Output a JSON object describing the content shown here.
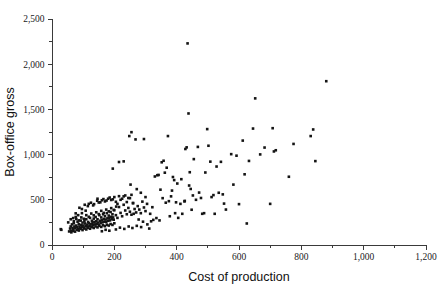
{
  "chart_data": {
    "type": "scatter",
    "title": "",
    "xlabel": "Cost of production",
    "ylabel": "Box-office gross",
    "xlim": [
      0,
      1200
    ],
    "ylim": [
      0,
      2500
    ],
    "grid": false,
    "legend": null,
    "x_ticks": [
      0,
      200,
      400,
      600,
      800,
      1000,
      1200
    ],
    "y_ticks": [
      0,
      500,
      1000,
      1500,
      2000,
      2500
    ],
    "x_tick_labels": [
      "0",
      "200",
      "400",
      "600",
      "800",
      "1,000",
      "1,200"
    ],
    "y_tick_labels": [
      "0",
      "500",
      "1,000",
      "1,500",
      "2,000",
      "2,500"
    ],
    "x_minor_step": 100,
    "y_minor_step": 250,
    "marker": "square",
    "marker_color": "#141414",
    "marker_size": 2.6,
    "points": [
      [
        28,
        175
      ],
      [
        30,
        168
      ],
      [
        55,
        150
      ],
      [
        58,
        182
      ],
      [
        60,
        205
      ],
      [
        62,
        158
      ],
      [
        64,
        228
      ],
      [
        66,
        190
      ],
      [
        68,
        172
      ],
      [
        70,
        240
      ],
      [
        72,
        205
      ],
      [
        74,
        185
      ],
      [
        76,
        350
      ],
      [
        78,
        215
      ],
      [
        80,
        196
      ],
      [
        82,
        258
      ],
      [
        84,
        178
      ],
      [
        86,
        232
      ],
      [
        88,
        205
      ],
      [
        90,
        188
      ],
      [
        92,
        270
      ],
      [
        94,
        222
      ],
      [
        96,
        200
      ],
      [
        98,
        248
      ],
      [
        100,
        215
      ],
      [
        102,
        192
      ],
      [
        104,
        262
      ],
      [
        106,
        238
      ],
      [
        108,
        208
      ],
      [
        110,
        285
      ],
      [
        112,
        225
      ],
      [
        114,
        198
      ],
      [
        116,
        255
      ],
      [
        118,
        240
      ],
      [
        120,
        212
      ],
      [
        122,
        300
      ],
      [
        124,
        232
      ],
      [
        126,
        205
      ],
      [
        128,
        268
      ],
      [
        130,
        245
      ],
      [
        132,
        218
      ],
      [
        134,
        292
      ],
      [
        136,
        255
      ],
      [
        138,
        228
      ],
      [
        140,
        310
      ],
      [
        142,
        262
      ],
      [
        144,
        235
      ],
      [
        146,
        285
      ],
      [
        148,
        248
      ],
      [
        150,
        222
      ],
      [
        152,
        330
      ],
      [
        154,
        268
      ],
      [
        156,
        242
      ],
      [
        158,
        305
      ],
      [
        160,
        275
      ],
      [
        162,
        250
      ],
      [
        164,
        340
      ],
      [
        166,
        288
      ],
      [
        168,
        258
      ],
      [
        170,
        318
      ],
      [
        172,
        282
      ],
      [
        174,
        255
      ],
      [
        176,
        352
      ],
      [
        178,
        295
      ],
      [
        180,
        268
      ],
      [
        182,
        325
      ],
      [
        184,
        298
      ],
      [
        186,
        272
      ],
      [
        188,
        365
      ],
      [
        190,
        312
      ],
      [
        192,
        285
      ],
      [
        194,
        340
      ],
      [
        196,
        305
      ],
      [
        198,
        280
      ],
      [
        200,
        385
      ],
      [
        205,
        330
      ],
      [
        210,
        300
      ],
      [
        215,
        420
      ],
      [
        220,
        355
      ],
      [
        225,
        318
      ],
      [
        230,
        445
      ],
      [
        235,
        382
      ],
      [
        240,
        340
      ],
      [
        245,
        410
      ],
      [
        250,
        368
      ],
      [
        255,
        335
      ],
      [
        260,
        465
      ],
      [
        265,
        398
      ],
      [
        270,
        360
      ],
      [
        275,
        430
      ],
      [
        280,
        392
      ],
      [
        285,
        352
      ],
      [
        290,
        480
      ],
      [
        295,
        415
      ],
      [
        300,
        375
      ],
      [
        62,
        140
      ],
      [
        68,
        155
      ],
      [
        74,
        148
      ],
      [
        80,
        168
      ],
      [
        86,
        160
      ],
      [
        92,
        178
      ],
      [
        98,
        165
      ],
      [
        104,
        182
      ],
      [
        110,
        172
      ],
      [
        116,
        190
      ],
      [
        122,
        180
      ],
      [
        128,
        198
      ],
      [
        134,
        188
      ],
      [
        140,
        205
      ],
      [
        146,
        195
      ],
      [
        152,
        212
      ],
      [
        158,
        200
      ],
      [
        164,
        218
      ],
      [
        170,
        208
      ],
      [
        176,
        225
      ],
      [
        182,
        215
      ],
      [
        188,
        232
      ],
      [
        194,
        222
      ],
      [
        200,
        240
      ],
      [
        70,
        262
      ],
      [
        78,
        288
      ],
      [
        86,
        272
      ],
      [
        94,
        305
      ],
      [
        102,
        290
      ],
      [
        110,
        330
      ],
      [
        118,
        312
      ],
      [
        126,
        348
      ],
      [
        134,
        328
      ],
      [
        142,
        362
      ],
      [
        150,
        342
      ],
      [
        158,
        378
      ],
      [
        166,
        355
      ],
      [
        174,
        392
      ],
      [
        182,
        372
      ],
      [
        190,
        408
      ],
      [
        198,
        388
      ],
      [
        206,
        425
      ],
      [
        88,
        412
      ],
      [
        96,
        398
      ],
      [
        105,
        445
      ],
      [
        115,
        430
      ],
      [
        125,
        468
      ],
      [
        135,
        452
      ],
      [
        145,
        490
      ],
      [
        155,
        472
      ],
      [
        165,
        508
      ],
      [
        175,
        492
      ],
      [
        185,
        525
      ],
      [
        195,
        505
      ],
      [
        205,
        478
      ],
      [
        215,
        540
      ],
      [
        225,
        512
      ],
      [
        235,
        548
      ],
      [
        245,
        520
      ],
      [
        255,
        555
      ],
      [
        150,
        470
      ],
      [
        160,
        495
      ],
      [
        170,
        482
      ],
      [
        180,
        512
      ],
      [
        190,
        498
      ],
      [
        200,
        530
      ],
      [
        210,
        455
      ],
      [
        220,
        500
      ],
      [
        230,
        538
      ],
      [
        240,
        475
      ],
      [
        250,
        518
      ],
      [
        260,
        462
      ],
      [
        195,
        845
      ],
      [
        215,
        918
      ],
      [
        230,
        925
      ],
      [
        248,
        1205
      ],
      [
        252,
        668
      ],
      [
        255,
        1248
      ],
      [
        268,
        1168
      ],
      [
        272,
        618
      ],
      [
        285,
        578
      ],
      [
        295,
        1172
      ],
      [
        300,
        530
      ],
      [
        305,
        455
      ],
      [
        312,
        182
      ],
      [
        318,
        262
      ],
      [
        325,
        278
      ],
      [
        330,
        758
      ],
      [
        338,
        772
      ],
      [
        342,
        775
      ],
      [
        348,
        612
      ],
      [
        352,
        915
      ],
      [
        358,
        932
      ],
      [
        362,
        800
      ],
      [
        368,
        855
      ],
      [
        372,
        1205
      ],
      [
        375,
        485
      ],
      [
        378,
        318
      ],
      [
        382,
        538
      ],
      [
        388,
        752
      ],
      [
        392,
        718
      ],
      [
        395,
        352
      ],
      [
        398,
        472
      ],
      [
        405,
        300
      ],
      [
        412,
        455
      ],
      [
        418,
        345
      ],
      [
        425,
        482
      ],
      [
        428,
        1062
      ],
      [
        432,
        1080
      ],
      [
        435,
        2230
      ],
      [
        438,
        1455
      ],
      [
        442,
        805
      ],
      [
        445,
        620
      ],
      [
        448,
        390
      ],
      [
        452,
        548
      ],
      [
        455,
        950
      ],
      [
        462,
        500
      ],
      [
        468,
        1085
      ],
      [
        472,
        580
      ],
      [
        478,
        520
      ],
      [
        482,
        345
      ],
      [
        488,
        352
      ],
      [
        492,
        802
      ],
      [
        498,
        1282
      ],
      [
        502,
        1098
      ],
      [
        508,
        922
      ],
      [
        512,
        530
      ],
      [
        518,
        552
      ],
      [
        522,
        345
      ],
      [
        528,
        868
      ],
      [
        535,
        578
      ],
      [
        542,
        920
      ],
      [
        548,
        560
      ],
      [
        552,
        458
      ],
      [
        558,
        392
      ],
      [
        575,
        1005
      ],
      [
        582,
        668
      ],
      [
        592,
        988
      ],
      [
        600,
        452
      ],
      [
        612,
        1155
      ],
      [
        618,
        782
      ],
      [
        625,
        238
      ],
      [
        632,
        930
      ],
      [
        645,
        1288
      ],
      [
        652,
        1622
      ],
      [
        668,
        1002
      ],
      [
        682,
        1078
      ],
      [
        700,
        455
      ],
      [
        708,
        1292
      ],
      [
        712,
        1035
      ],
      [
        718,
        1048
      ],
      [
        760,
        755
      ],
      [
        775,
        1118
      ],
      [
        830,
        1205
      ],
      [
        838,
        1278
      ],
      [
        845,
        928
      ],
      [
        880,
        1812
      ],
      [
        118,
        455
      ],
      [
        132,
        438
      ],
      [
        146,
        512
      ],
      [
        108,
        380
      ],
      [
        96,
        352
      ],
      [
        84,
        330
      ],
      [
        76,
        310
      ],
      [
        68,
        298
      ],
      [
        60,
        285
      ],
      [
        52,
        250
      ],
      [
        262,
        345
      ],
      [
        278,
        282
      ],
      [
        292,
        258
      ],
      [
        306,
        228
      ],
      [
        315,
        345
      ],
      [
        322,
        418
      ],
      [
        335,
        298
      ],
      [
        345,
        272
      ],
      [
        355,
        518
      ],
      [
        365,
        468
      ],
      [
        385,
        602
      ],
      [
        402,
        680
      ],
      [
        415,
        728
      ],
      [
        426,
        488
      ],
      [
        440,
        658
      ],
      [
        205,
        172
      ],
      [
        218,
        192
      ],
      [
        232,
        178
      ],
      [
        246,
        205
      ],
      [
        258,
        188
      ],
      [
        272,
        212
      ],
      [
        286,
        198
      ],
      [
        160,
        152
      ],
      [
        172,
        168
      ],
      [
        184,
        158
      ]
    ]
  }
}
